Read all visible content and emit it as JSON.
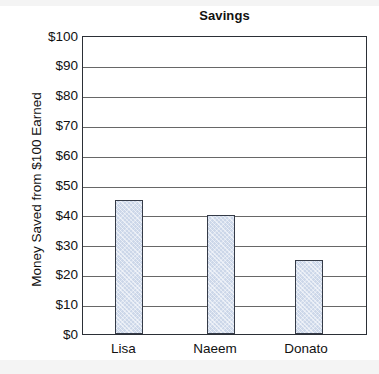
{
  "chart_data": {
    "type": "bar",
    "title": "Savings",
    "xlabel": "",
    "ylabel": "Money Saved from $100 Earned",
    "categories": [
      "Lisa",
      "Naeem",
      "Donato"
    ],
    "values": [
      45,
      40,
      25
    ],
    "ylim": [
      0,
      100
    ],
    "ytick_step": 10,
    "ytick_labels": [
      "$100",
      "$90",
      "$80",
      "$70",
      "$60",
      "$50",
      "$40",
      "$30",
      "$20",
      "$10",
      "$0"
    ],
    "ytick_values": [
      100,
      90,
      80,
      70,
      60,
      50,
      40,
      30,
      20,
      10,
      0
    ],
    "grid": true,
    "grid_axis": "y",
    "legend": false,
    "legend_position": "none",
    "bar_fill_color": "#ccd7e9",
    "bar_border_color": "#353b47",
    "axis_color": "#2b2f36",
    "grid_color": "#676767",
    "background_color": "#ffffff",
    "text_color": "#111111"
  }
}
